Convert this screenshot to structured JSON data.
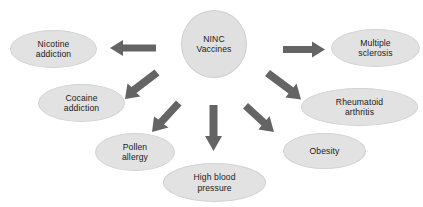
{
  "diagram": {
    "type": "radial-hub-and-spoke",
    "center": {
      "id": "ninc-vaccines",
      "label": "NINC\nVaccines",
      "shape": "circle",
      "fill": "#e0e0e0",
      "stroke": "#cfcfcf",
      "x": 181,
      "y": 10,
      "width": 66,
      "height": 68
    },
    "nodes": [
      {
        "id": "nicotine-addiction",
        "label": "Nicotine\naddiction",
        "shape": "ellipse",
        "fill": "#e2e2e2",
        "stroke": "#d2d2d2",
        "x": 10,
        "y": 30,
        "width": 87,
        "height": 38
      },
      {
        "id": "cocaine-addiction",
        "label": "Cocaine\naddiction",
        "shape": "ellipse",
        "fill": "#e2e2e2",
        "stroke": "#d2d2d2",
        "x": 38,
        "y": 84,
        "width": 87,
        "height": 38
      },
      {
        "id": "pollen-allergy",
        "label": "Pollen\nallergy",
        "shape": "ellipse",
        "fill": "#e2e2e2",
        "stroke": "#d2d2d2",
        "x": 95,
        "y": 133,
        "width": 80,
        "height": 38
      },
      {
        "id": "high-blood-pressure",
        "label": "High blood\npressure",
        "shape": "ellipse",
        "fill": "#e2e2e2",
        "stroke": "#d2d2d2",
        "x": 163,
        "y": 163,
        "width": 103,
        "height": 39
      },
      {
        "id": "obesity",
        "label": "Obesity",
        "shape": "ellipse",
        "fill": "#e2e2e2",
        "stroke": "#d2d2d2",
        "x": 283,
        "y": 133,
        "width": 83,
        "height": 36
      },
      {
        "id": "rheumatoid-arthritis",
        "label": "Rheumatoid\narthritis",
        "shape": "ellipse",
        "fill": "#e2e2e2",
        "stroke": "#d2d2d2",
        "x": 301,
        "y": 88,
        "width": 117,
        "height": 38
      },
      {
        "id": "multiple-sclerosis",
        "label": "Multiple\nsclerosis",
        "shape": "ellipse",
        "fill": "#e2e2e2",
        "stroke": "#d2d2d2",
        "x": 331,
        "y": 29,
        "width": 89,
        "height": 38
      }
    ],
    "arrows": [
      {
        "id": "arrow-to-nicotine-addiction",
        "from": "ninc-vaccines",
        "to": "nicotine-addiction",
        "direction": "left",
        "color": "#646464"
      },
      {
        "id": "arrow-to-cocaine-addiction",
        "from": "ninc-vaccines",
        "to": "cocaine-addiction",
        "direction": "down-left",
        "color": "#646464"
      },
      {
        "id": "arrow-to-pollen-allergy",
        "from": "ninc-vaccines",
        "to": "pollen-allergy",
        "direction": "down-left",
        "color": "#646464"
      },
      {
        "id": "arrow-to-high-blood-pressure",
        "from": "ninc-vaccines",
        "to": "high-blood-pressure",
        "direction": "down",
        "color": "#646464"
      },
      {
        "id": "arrow-to-obesity",
        "from": "ninc-vaccines",
        "to": "obesity",
        "direction": "down-right",
        "color": "#646464"
      },
      {
        "id": "arrow-to-rheumatoid-arthritis",
        "from": "ninc-vaccines",
        "to": "rheumatoid-arthritis",
        "direction": "down-right",
        "color": "#646464"
      },
      {
        "id": "arrow-to-multiple-sclerosis",
        "from": "ninc-vaccines",
        "to": "multiple-sclerosis",
        "direction": "right",
        "color": "#646464"
      }
    ]
  }
}
